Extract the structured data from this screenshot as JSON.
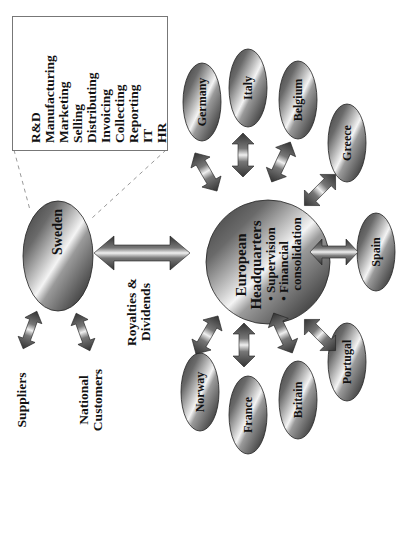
{
  "functions_box": {
    "items": [
      "R&D",
      "Manufacturing",
      "Marketing",
      "Selling",
      "Distributing",
      "Invoicing",
      "Collecting",
      "Reporting",
      "IT",
      "HR"
    ]
  },
  "sweden": {
    "label": "Sweden"
  },
  "external": {
    "suppliers": "Suppliers",
    "national_customers_line1": "National",
    "national_customers_line2": "Customers"
  },
  "flow": {
    "royalties_line1": "Royalties &",
    "royalties_line2": "Dividends"
  },
  "headquarters": {
    "title_line1": "European",
    "title_line2": "Headquarters",
    "bullet1": "• Supervision",
    "bullet2_line1": "• Financial",
    "bullet2_line2": "consolidation"
  },
  "countries": {
    "germany": "Germany",
    "italy": "Italy",
    "belgium": "Belgium",
    "greece": "Greece",
    "spain": "Spain",
    "portugal": "Portugal",
    "britain": "Britain",
    "france": "France",
    "norway": "Norway"
  },
  "colors": {
    "ellipse_dark": "#2a2a2a",
    "ellipse_mid": "#6e6e6e",
    "ellipse_highlight": "#f2f2f2",
    "text": "#111111",
    "dashed_line": "#999999"
  }
}
